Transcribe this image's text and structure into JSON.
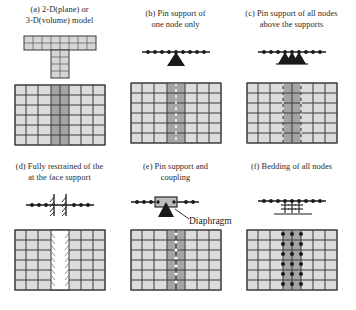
{
  "figure": {
    "colors": {
      "mesh_line": "#3b3b3b",
      "mesh_fill_light": "#d8d8d8",
      "mesh_fill_dark": "#9a9a9a",
      "symbol_black": "#1a1a1a",
      "background": "#ffffff",
      "white_band": "#ffffff"
    }
  },
  "panels": [
    {
      "id": "a",
      "label": "(a)",
      "caption_line1": "(a) 2-D(plane) or",
      "caption_line2": "3-D(volume) model",
      "symbol": "t-shaped-solid-mesh",
      "mesh": "uniform-grid-dark-center-band",
      "nodes": 0,
      "triangles": 0
    },
    {
      "id": "b",
      "label": "(b)",
      "caption_line1": "(b) Pin support of",
      "caption_line2": "one node only",
      "symbol": "node-line-single-triangle",
      "mesh": "grid-dark-band-dashed-line",
      "nodes": 9,
      "triangles": 1
    },
    {
      "id": "c",
      "label": "(c)",
      "caption_line1": "(c) Pin support of all nodes",
      "caption_line2": "above the supports",
      "symbol": "node-line-three-triangles",
      "mesh": "grid-dark-band-two-dashed-lines",
      "nodes": 9,
      "triangles": 3
    },
    {
      "id": "d",
      "label": "(d)",
      "caption_line1": "(d) Fully restrained of the",
      "caption_line2": "at the face support",
      "symbol": "node-line-hatched-fixed-wall",
      "mesh": "grid-white-band-hatched-edges",
      "nodes": 8,
      "triangles": 0
    },
    {
      "id": "e",
      "label": "(e)",
      "caption_line1": "(e) Pin support and",
      "caption_line2": "coupling",
      "symbol": "node-line-diaphragm-triangle",
      "mesh": "grid-dark-band-dashed-line",
      "nodes": 9,
      "triangles": 1,
      "annotation": "Diaphragm"
    },
    {
      "id": "f",
      "label": "(f)",
      "caption_line1": "(f) Bedding of all nodes",
      "caption_line2": "",
      "symbol": "node-line-springs-baseline",
      "mesh": "grid-dark-band-node-dots",
      "nodes": 9,
      "springs": 3
    }
  ],
  "annotations": {
    "diaphragm_label": "Diaphragm"
  }
}
